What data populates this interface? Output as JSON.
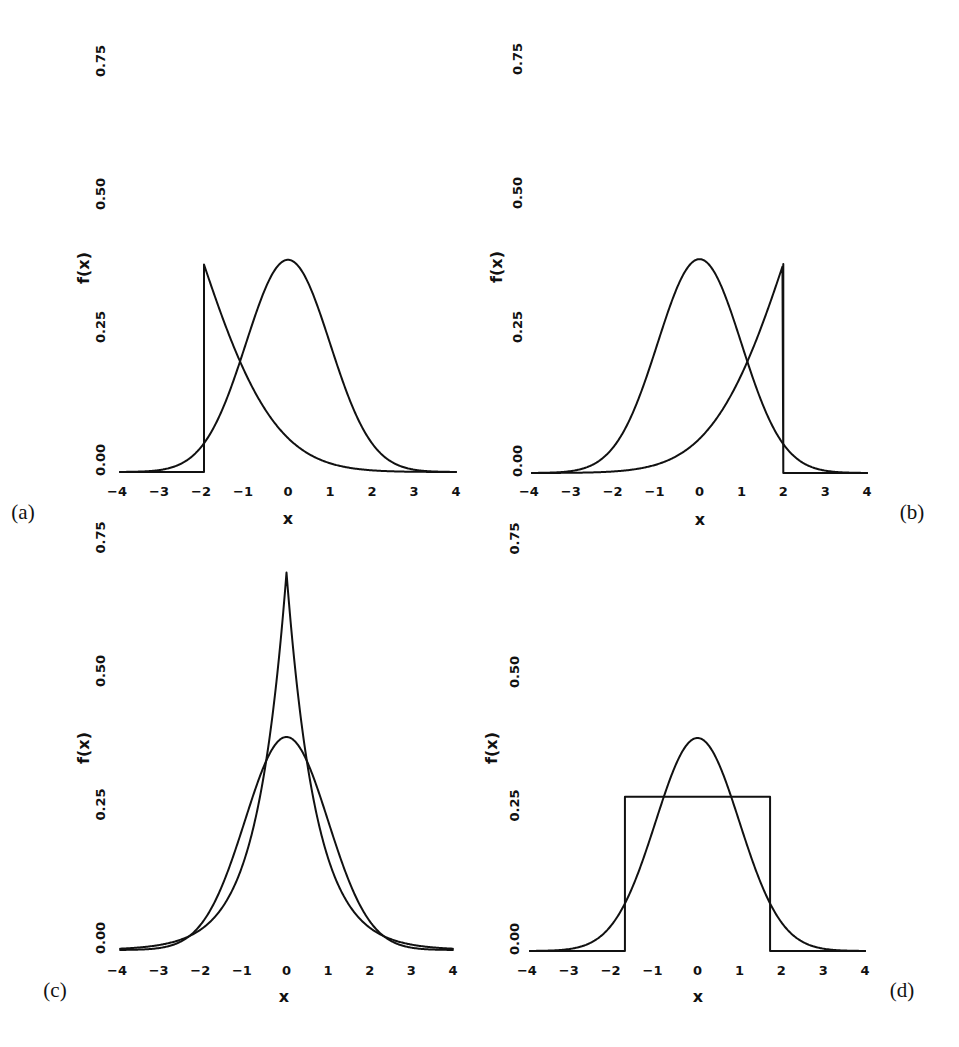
{
  "figure": {
    "panel_labels": [
      "(a)",
      "(b)",
      "(c)",
      "(d)"
    ],
    "xlabel": "x",
    "ylabel": "f(x)"
  },
  "chart_data": [
    {
      "type": "line",
      "panel": "(a)",
      "title": "",
      "xlabel": "x",
      "ylabel": "f(x)",
      "xlim": [
        -4,
        4
      ],
      "ylim": [
        0,
        0.75
      ],
      "x_ticks": [
        "-4",
        "-3",
        "-2",
        "-1",
        "0",
        "1",
        "2",
        "3",
        "4"
      ],
      "y_ticks": [
        "0.00",
        "0.25",
        "0.50",
        "0.75"
      ],
      "grid": false,
      "legend": null,
      "series": [
        {
          "name": "standard normal",
          "kind": "normal",
          "mean": 0,
          "sd": 1,
          "peak": 0.399
        },
        {
          "name": "left-truncated skewed density (mode at x=-2)",
          "kind": "truncated_left",
          "edge": -2,
          "peak": 0.39,
          "a": 0.605,
          "b": 0.15,
          "sample_points": [
            [
              -2,
              0.39
            ],
            [
              -1.54,
              0.286
            ],
            [
              -1.19,
              0.2
            ],
            [
              -0.36,
              0.092
            ],
            [
              0.45,
              0.036
            ],
            [
              2,
              0.005
            ],
            [
              4,
              0.0
            ]
          ]
        }
      ]
    },
    {
      "type": "line",
      "panel": "(b)",
      "title": "",
      "xlabel": "x",
      "ylabel": "f(x)",
      "xlim": [
        -4,
        4
      ],
      "ylim": [
        0,
        0.75
      ],
      "x_ticks": [
        "-4",
        "-3",
        "-2",
        "-1",
        "0",
        "1",
        "2",
        "3",
        "4"
      ],
      "y_ticks": [
        "0.00",
        "0.25",
        "0.50",
        "0.75"
      ],
      "grid": false,
      "legend": null,
      "series": [
        {
          "name": "standard normal",
          "kind": "normal",
          "mean": 0,
          "sd": 1,
          "peak": 0.399
        },
        {
          "name": "right-truncated skewed density (mode at x=2)",
          "kind": "truncated_right",
          "edge": 2,
          "peak": 0.39,
          "a": 0.605,
          "b": 0.15,
          "sample_points": [
            [
              -4,
              0.0
            ],
            [
              -2,
              0.005
            ],
            [
              -0.45,
              0.036
            ],
            [
              0.36,
              0.092
            ],
            [
              1.19,
              0.2
            ],
            [
              1.54,
              0.286
            ],
            [
              2,
              0.39
            ]
          ]
        }
      ]
    },
    {
      "type": "line",
      "panel": "(c)",
      "title": "",
      "xlabel": "x",
      "ylabel": "f(x)",
      "xlim": [
        -4,
        4
      ],
      "ylim": [
        0,
        0.75
      ],
      "x_ticks": [
        "-4",
        "-3",
        "-2",
        "-1",
        "0",
        "1",
        "2",
        "3",
        "4"
      ],
      "y_ticks": [
        "0.00",
        "0.25",
        "0.50",
        "0.75"
      ],
      "grid": false,
      "legend": null,
      "series": [
        {
          "name": "standard normal",
          "kind": "normal",
          "mean": 0,
          "sd": 1,
          "peak": 0.399
        },
        {
          "name": "Laplace (double exponential, unit variance)",
          "kind": "laplace",
          "peak": 0.707,
          "rate": 1.414
        }
      ]
    },
    {
      "type": "line",
      "panel": "(d)",
      "title": "",
      "xlabel": "x",
      "ylabel": "f(x)",
      "xlim": [
        -4,
        4
      ],
      "ylim": [
        0,
        0.75
      ],
      "x_ticks": [
        "-4",
        "-3",
        "-2",
        "-1",
        "0",
        "1",
        "2",
        "3",
        "4"
      ],
      "y_ticks": [
        "0.00",
        "0.25",
        "0.50",
        "0.75"
      ],
      "grid": false,
      "legend": null,
      "series": [
        {
          "name": "standard normal",
          "kind": "normal",
          "mean": 0,
          "sd": 1,
          "peak": 0.399
        },
        {
          "name": "uniform (unit variance)",
          "kind": "uniform",
          "low": -1.732,
          "high": 1.732,
          "height": 0.289
        }
      ]
    }
  ]
}
